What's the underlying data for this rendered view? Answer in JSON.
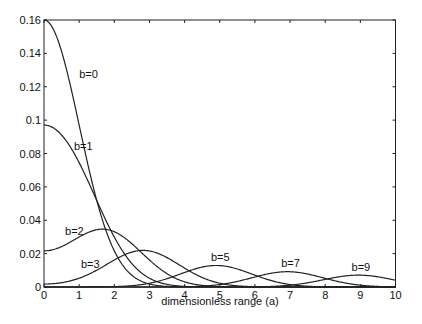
{
  "chart_data": {
    "type": "line",
    "title": "",
    "xlabel": "dimensionless range (a)",
    "ylabel": "",
    "xlim": [
      0,
      10
    ],
    "ylim": [
      0,
      0.16
    ],
    "grid": false,
    "legend": "inline labels",
    "x_ticks": [
      "0",
      "1",
      "2",
      "3",
      "4",
      "5",
      "6",
      "7",
      "8",
      "9",
      "10"
    ],
    "y_ticks": [
      "0",
      "0.02",
      "0.04",
      "0.06",
      "0.08",
      "0.1",
      "0.12",
      "0.14",
      "0.16"
    ],
    "model": "y = 0.16 * exp(-(a^2+b^2)/2) * I0(a*b)",
    "x": [
      0,
      0.5,
      1,
      1.5,
      2,
      2.5,
      3,
      3.5,
      4,
      4.5,
      5,
      5.5,
      6,
      6.5,
      7,
      7.5,
      8,
      8.5,
      9,
      9.5,
      10
    ],
    "series": [
      {
        "name": "b=0",
        "b": 0,
        "label_pos": [
          1.0,
          0.125
        ],
        "values": [
          0.16,
          0.141,
          0.097,
          0.052,
          0.0217,
          0.007,
          0.0018,
          0.0003,
          0.0001,
          0,
          0,
          0,
          0,
          0,
          0,
          0,
          0,
          0,
          0,
          0,
          0
        ]
      },
      {
        "name": "b=1",
        "b": 1,
        "label_pos": [
          0.85,
          0.082
        ],
        "values": [
          0.097,
          0.091,
          0.075,
          0.053,
          0.033,
          0.017,
          0.0075,
          0.0027,
          0.0008,
          0.0002,
          0,
          0,
          0,
          0,
          0,
          0,
          0,
          0,
          0,
          0,
          0
        ]
      },
      {
        "name": "b=2",
        "b": 2,
        "label_pos": [
          0.6,
          0.031
        ],
        "values": [
          0.0217,
          0.024,
          0.029,
          0.033,
          0.034,
          0.031,
          0.025,
          0.017,
          0.0095,
          0.0045,
          0.0018,
          0.0006,
          0.0002,
          0,
          0,
          0,
          0,
          0,
          0,
          0,
          0
        ]
      },
      {
        "name": "b=3",
        "b": 3,
        "label_pos": [
          1.05,
          0.0115
        ],
        "values": [
          0.0018,
          0.0025,
          0.005,
          0.009,
          0.014,
          0.019,
          0.022,
          0.021,
          0.018,
          0.013,
          0.008,
          0.0042,
          0.0019,
          0.0007,
          0.0002,
          0,
          0,
          0,
          0,
          0,
          0
        ]
      },
      {
        "name": "b=5",
        "b": 5,
        "label_pos": [
          4.75,
          0.0155
        ],
        "values": [
          0,
          0,
          0,
          0.0001,
          0.0004,
          0.0012,
          0.003,
          0.0058,
          0.0093,
          0.012,
          0.0128,
          0.0118,
          0.0093,
          0.0062,
          0.0035,
          0.0017,
          0.0007,
          0.0002,
          0.0001,
          0,
          0
        ]
      },
      {
        "name": "b=7",
        "b": 7,
        "label_pos": [
          6.75,
          0.0118
        ],
        "values": [
          0,
          0,
          0,
          0,
          0,
          0,
          0,
          0.0002,
          0.0006,
          0.0015,
          0.0031,
          0.0054,
          0.0078,
          0.0093,
          0.0096,
          0.0088,
          0.007,
          0.0048,
          0.0029,
          0.0015,
          0.0007
        ]
      },
      {
        "name": "b=9",
        "b": 9,
        "label_pos": [
          8.75,
          0.0098
        ],
        "values": [
          0,
          0,
          0,
          0,
          0,
          0,
          0,
          0,
          0,
          0,
          0.0001,
          0.0003,
          0.0009,
          0.0019,
          0.0035,
          0.0053,
          0.0068,
          0.0075,
          0.0073,
          0.0063,
          0.0048
        ]
      }
    ]
  }
}
